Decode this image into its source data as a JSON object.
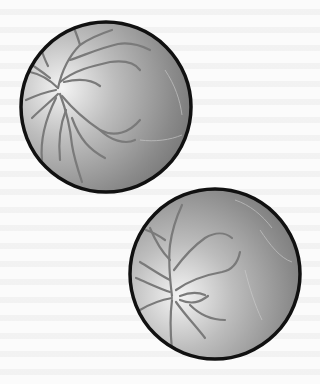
{
  "figure": {
    "background_color": "#fbfbfb",
    "rim_color": "#111111",
    "vessel_color": "#7a7a7a",
    "fundi": [
      {
        "name": "upper-fundus",
        "cx": 106,
        "cy": 107,
        "r": 85,
        "optic_disc": [
          62,
          88
        ]
      },
      {
        "name": "lower-fundus",
        "cx": 215,
        "cy": 274,
        "r": 85,
        "optic_disc": [
          175,
          296
        ]
      }
    ]
  }
}
